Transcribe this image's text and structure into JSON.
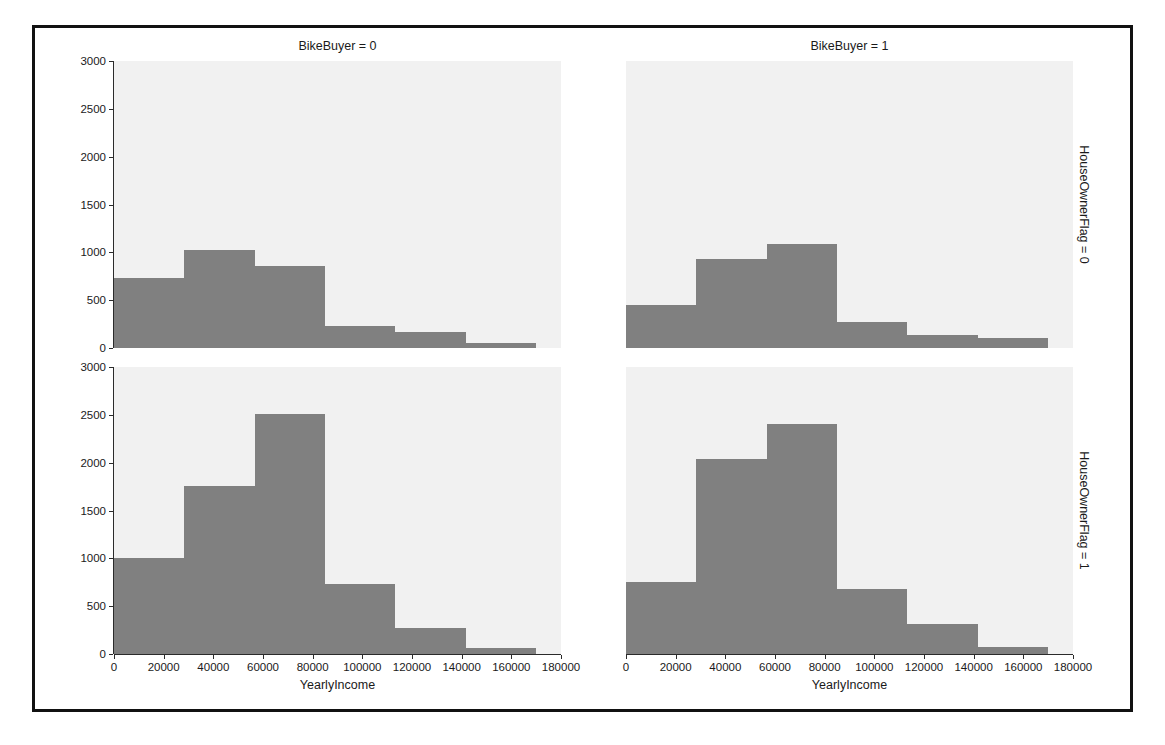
{
  "figure": {
    "xlabel": "YearlyIncome",
    "col_titles": [
      "BikeBuyer = 0",
      "BikeBuyer = 1"
    ],
    "row_labels": [
      "HouseOwnerFlag = 0",
      "HouseOwnerFlag = 1"
    ],
    "bar_color": "#808080",
    "panel_bg": "#f1f1f1",
    "frame_color": "#111111"
  },
  "chart_data": {
    "type": "bar",
    "title": "",
    "xlabel": "YearlyIncome",
    "ylabel": "",
    "grid": false,
    "legend": "none",
    "xlim": [
      0,
      180000
    ],
    "ylim": [
      0,
      3000
    ],
    "xticks": [
      0,
      20000,
      40000,
      60000,
      80000,
      100000,
      120000,
      140000,
      160000,
      180000
    ],
    "xtick_labels": [
      "0",
      "20000",
      "40000",
      "60000",
      "80000",
      "100000",
      "120000",
      "140000",
      "160000",
      "180000"
    ],
    "yticks": [
      0,
      500,
      1000,
      1500,
      2000,
      2500,
      3000
    ],
    "ytick_labels": [
      "0",
      "500",
      "1000",
      "1500",
      "2000",
      "2500",
      "3000"
    ],
    "bin_edges": [
      0,
      28333,
      56667,
      85000,
      113333,
      141667,
      170000
    ],
    "facet_rows": [
      "HouseOwnerFlag = 0",
      "HouseOwnerFlag = 1"
    ],
    "facet_cols": [
      "BikeBuyer = 0",
      "BikeBuyer = 1"
    ],
    "panels": [
      {
        "row": 0,
        "col": 0,
        "col_title": "BikeBuyer = 0",
        "row_label": "HouseOwnerFlag = 0",
        "values": [
          730,
          1020,
          860,
          235,
          170,
          55
        ]
      },
      {
        "row": 0,
        "col": 1,
        "col_title": "BikeBuyer = 1",
        "row_label": "HouseOwnerFlag = 0",
        "values": [
          450,
          930,
          1090,
          270,
          140,
          100
        ]
      },
      {
        "row": 1,
        "col": 0,
        "col_title": "BikeBuyer = 0",
        "row_label": "HouseOwnerFlag = 1",
        "values": [
          1000,
          1760,
          2510,
          730,
          270,
          60
        ]
      },
      {
        "row": 1,
        "col": 1,
        "col_title": "BikeBuyer = 1",
        "row_label": "HouseOwnerFlag = 1",
        "values": [
          750,
          2040,
          2400,
          680,
          310,
          70
        ]
      }
    ]
  }
}
